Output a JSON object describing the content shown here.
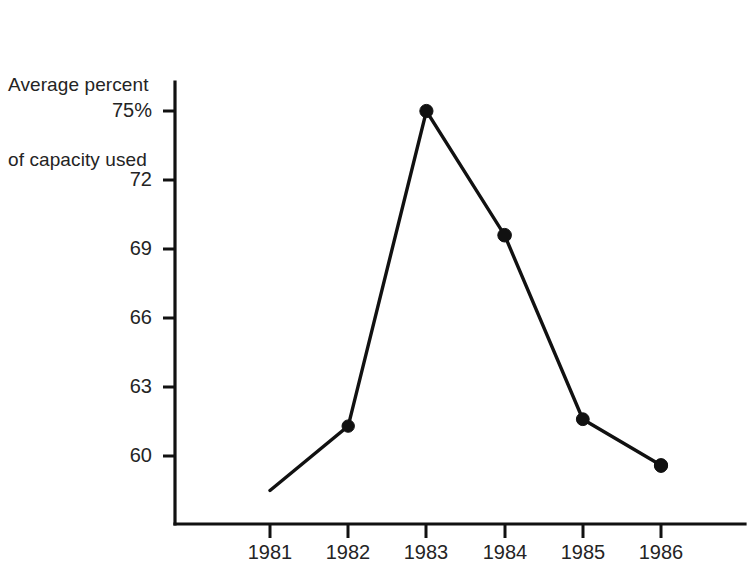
{
  "chart_data": {
    "type": "line",
    "title": "Average percent of capacity used",
    "title_lines": [
      "Average percent",
      "of capacity used"
    ],
    "xlabel": "",
    "ylabel": "",
    "categories": [
      "1981",
      "1982",
      "1983",
      "1984",
      "1985",
      "1986"
    ],
    "values": [
      58.5,
      61.3,
      75.0,
      69.6,
      61.6,
      59.6
    ],
    "series": [
      {
        "name": "Average percent of capacity used",
        "values": [
          58.5,
          61.3,
          75.0,
          69.6,
          61.6,
          59.6
        ]
      }
    ],
    "y_tick_labels": [
      "75%",
      "72",
      "69",
      "66",
      "63",
      "60"
    ],
    "y_tick_values": [
      75,
      72,
      69,
      66,
      63,
      60
    ],
    "x_tick_labels": [
      "1981",
      "1982",
      "1983",
      "1984",
      "1985",
      "1986"
    ],
    "ylim": [
      56.5,
      76.8
    ],
    "xlim": [
      0.5,
      6.5
    ],
    "grid": false,
    "legend": false,
    "legend_position": "none",
    "marker": "filled-circle",
    "line_color": "#111111",
    "marker_color": "#111111",
    "background_color": "#ffffff",
    "axis_color": "#111111"
  }
}
